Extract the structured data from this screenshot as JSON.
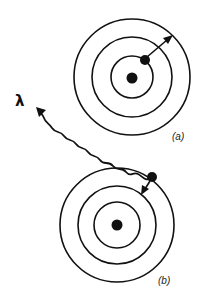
{
  "diagram": {
    "colors": {
      "ink": "#111111",
      "background": "#ffffff"
    },
    "panels": [
      {
        "id": "a",
        "label": "(a)",
        "description": "Electron excited from second orbit to outer orbit (absorption)",
        "nucleus": {
          "cx": 132,
          "cy": 78,
          "r": 5.5
        },
        "orbits_r": [
          21,
          40,
          58
        ],
        "electron": {
          "cx": 145,
          "cy": 60,
          "r": 5
        },
        "transition_arrow": {
          "from": [
            145,
            60
          ],
          "to": [
            172,
            36
          ],
          "direction": "outward"
        }
      },
      {
        "id": "b",
        "label": "(b)",
        "description": "Electron falls from outer orbit to second orbit, emitting a photon",
        "nucleus": {
          "cx": 117,
          "cy": 225,
          "r": 5.5
        },
        "orbits_r": [
          23,
          39,
          57
        ],
        "electron": {
          "cx": 152,
          "cy": 177,
          "r": 5
        },
        "transition_arrow": {
          "from": [
            152,
            177
          ],
          "to": [
            142,
            193
          ],
          "direction": "inward"
        }
      }
    ],
    "photon": {
      "symbol": "λ",
      "label_position": [
        22,
        101
      ],
      "from": [
        150,
        178
      ],
      "to": [
        37,
        108
      ],
      "shape": "wavy-arrow"
    }
  }
}
